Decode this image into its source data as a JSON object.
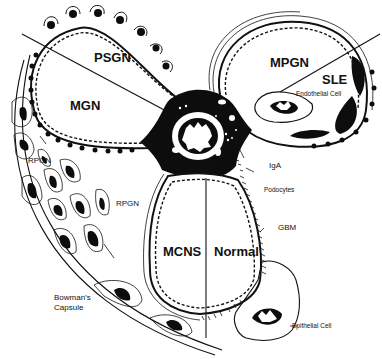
{
  "diagram": {
    "loop_labels": {
      "psgn": "PSGN",
      "mgn": "MGN",
      "mpgn": "MPGN",
      "sle": "SLE",
      "mcns": "MCNS",
      "normal": "Normal"
    },
    "annotations": {
      "endothelial_cell": "Endothelial Cell",
      "mesangium": "M",
      "iga": "IgA",
      "podocytes": "Podocytes",
      "gbm": "GBM",
      "epithelial_cell": "Epithelial Cell",
      "rpgn_top": "RPGN",
      "rpgn_mid": "RPGN",
      "bowmans_capsule_line1": "Bowman's",
      "bowmans_capsule_line2": "Capsule"
    },
    "colors": {
      "ink": "#111111",
      "background": "#ffffff"
    }
  }
}
